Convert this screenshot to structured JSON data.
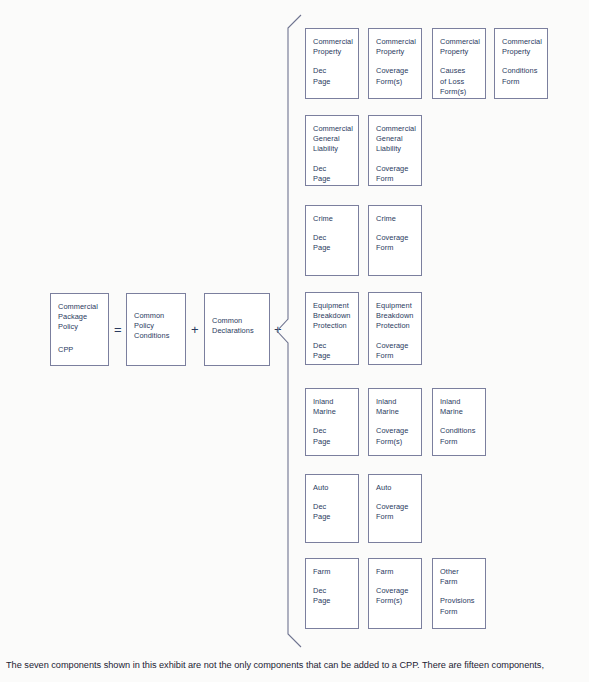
{
  "diagram": {
    "colors": {
      "box_border": "#7b7f9e",
      "text": "#2a3a5e",
      "background": "#fbfbfa",
      "bracket": "#6f7490",
      "caption_text": "#1b2233"
    },
    "equation": {
      "left_box": {
        "lines_group_1": [
          "Commercial",
          "Package",
          "Policy"
        ],
        "lines_group_2": [
          "CPP"
        ]
      },
      "operator_equals": "=",
      "conditions_box": {
        "lines_group_1": [
          "Common",
          "Policy",
          "Conditions"
        ]
      },
      "operator_plus_1": "+",
      "declarations_box": {
        "lines_group_1": [
          "Common",
          "Declarations"
        ]
      },
      "operator_plus_2": "+"
    },
    "components": [
      {
        "name": "commercial-property",
        "boxes": [
          {
            "group_1": [
              "Commercial",
              "Property"
            ],
            "group_2": [
              "Dec",
              "Page"
            ]
          },
          {
            "group_1": [
              "Commercial",
              "Property"
            ],
            "group_2": [
              "Coverage",
              "Form(s)"
            ]
          },
          {
            "group_1": [
              "Commercial",
              "Property"
            ],
            "group_2": [
              "Causes",
              "of Loss",
              "Form(s)"
            ]
          },
          {
            "group_1": [
              "Commercial",
              "Property"
            ],
            "group_2": [
              "Conditions",
              "Form"
            ]
          }
        ]
      },
      {
        "name": "commercial-general-liability",
        "boxes": [
          {
            "group_1": [
              "Commercial",
              "General",
              "Liability"
            ],
            "group_2": [
              "Dec",
              "Page"
            ]
          },
          {
            "group_1": [
              "Commercial",
              "General",
              "Liability"
            ],
            "group_2": [
              "Coverage",
              "Form"
            ]
          }
        ]
      },
      {
        "name": "crime",
        "boxes": [
          {
            "group_1": [
              "Crime"
            ],
            "group_2": [
              "Dec",
              "Page"
            ]
          },
          {
            "group_1": [
              "Crime"
            ],
            "group_2": [
              "Coverage",
              "Form"
            ]
          }
        ]
      },
      {
        "name": "equipment-breakdown-protection",
        "boxes": [
          {
            "group_1": [
              "Equipment",
              "Breakdown",
              "Protection"
            ],
            "group_2": [
              "Dec",
              "Page"
            ]
          },
          {
            "group_1": [
              "Equipment",
              "Breakdown",
              "Protection"
            ],
            "group_2": [
              "Coverage",
              "Form"
            ]
          }
        ]
      },
      {
        "name": "inland-marine",
        "boxes": [
          {
            "group_1": [
              "Inland",
              "Marine"
            ],
            "group_2": [
              "Dec",
              "Page"
            ]
          },
          {
            "group_1": [
              "Inland",
              "Marine"
            ],
            "group_2": [
              "Coverage",
              "Form(s)"
            ]
          },
          {
            "group_1": [
              "Inland",
              "Marine"
            ],
            "group_2": [
              "Conditions",
              "Form"
            ]
          }
        ]
      },
      {
        "name": "auto",
        "boxes": [
          {
            "group_1": [
              "Auto"
            ],
            "group_2": [
              "Dec",
              "Page"
            ]
          },
          {
            "group_1": [
              "Auto"
            ],
            "group_2": [
              "Coverage",
              "Form"
            ]
          }
        ]
      },
      {
        "name": "farm",
        "boxes": [
          {
            "group_1": [
              "Farm"
            ],
            "group_2": [
              "Dec",
              "Page"
            ]
          },
          {
            "group_1": [
              "Farm"
            ],
            "group_2": [
              "Coverage",
              "Form(s)"
            ]
          },
          {
            "group_1": [
              "Other",
              "Farm"
            ],
            "group_2": [
              "Provisions",
              "Form"
            ]
          }
        ]
      }
    ],
    "caption": "The seven components shown in this exhibit are not the only components that can be added to a CPP. There are fifteen components,"
  }
}
